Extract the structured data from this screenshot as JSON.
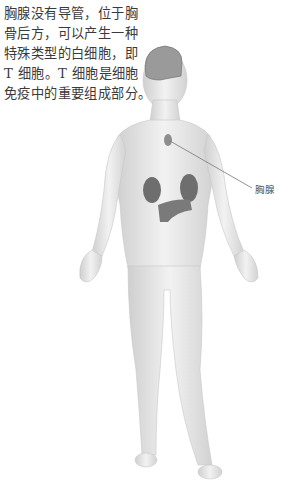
{
  "caption": {
    "lines": [
      "胸腺没有导管，位于胸",
      "骨后方，可以产生一种",
      "特殊类型的白细胞，即",
      "T 细胞。T 细胞是细胞",
      "免疫中的重要组成部分。"
    ]
  },
  "figure": {
    "callout_label": "胸腺",
    "colors": {
      "skin": "#e6e6e6",
      "skin_shade": "#cfcfcf",
      "organ": "#6e6e6e",
      "brain": "#8a8a8a",
      "leader_line": "#777777"
    }
  }
}
